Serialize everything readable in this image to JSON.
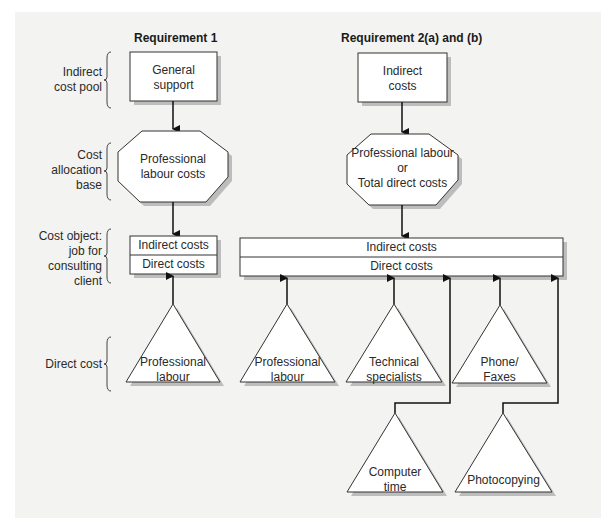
{
  "headers": {
    "req1": "Requirement 1",
    "req2": "Requirement 2(a) and (b)"
  },
  "row_labels": {
    "indirect_cost_pool": [
      "Indirect",
      "cost pool"
    ],
    "cost_allocation_base": [
      "Cost",
      "allocation",
      "base"
    ],
    "cost_object": [
      "Cost object:",
      "job for",
      "consulting",
      "client"
    ],
    "direct_cost": [
      "Direct cost"
    ]
  },
  "req1": {
    "pool": [
      "General",
      "support"
    ],
    "base": [
      "Professional",
      "labour costs"
    ],
    "object_indirect": "Indirect costs",
    "object_direct": "Direct costs",
    "direct_costs": [
      {
        "label": [
          "Professional",
          "labour"
        ]
      }
    ]
  },
  "req2": {
    "pool": [
      "Indirect",
      "costs"
    ],
    "base": [
      "Professional labour",
      "or",
      "Total direct costs"
    ],
    "object_indirect": "Indirect costs",
    "object_direct": "Direct costs",
    "direct_costs": [
      {
        "label": [
          "Professional",
          "labour"
        ]
      },
      {
        "label": [
          "Technical",
          "specialists"
        ]
      },
      {
        "label": [
          "Phone/",
          "Faxes"
        ]
      },
      {
        "label": [
          "Computer",
          "time"
        ]
      },
      {
        "label": [
          "Photocopying"
        ]
      }
    ]
  },
  "colors": {
    "background": "#f3f3f1",
    "shape_fill": "#ffffff",
    "stroke": "#333333",
    "shadow": "#bdbdbd"
  }
}
